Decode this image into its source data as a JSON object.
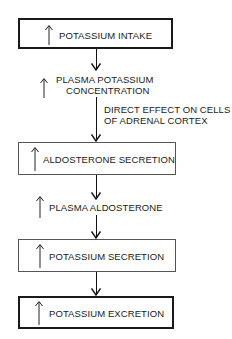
{
  "diagram": {
    "boxes": [
      {
        "label": "POTASSIUM INTAKE",
        "prefix": "up-arrow"
      },
      {
        "label": "ALDOSTERONE SECRETION",
        "prefix": "up-arrow"
      },
      {
        "label": "POTASSIUM SECRETION",
        "prefix": "up-arrow"
      },
      {
        "label": "POTASSIUM EXCRETION",
        "prefix": "up-arrow"
      }
    ],
    "intermediates": [
      {
        "line1": "PLASMA POTASSIUM",
        "line2": "CONCENTRATION",
        "prefix": "up-arrow"
      },
      {
        "line1": "PLASMA ALDOSTERONE",
        "prefix": "up-arrow"
      }
    ],
    "annotation": {
      "line1": "DIRECT EFFECT ON CELLS",
      "line2": "OF ADRENAL CORTEX"
    }
  }
}
